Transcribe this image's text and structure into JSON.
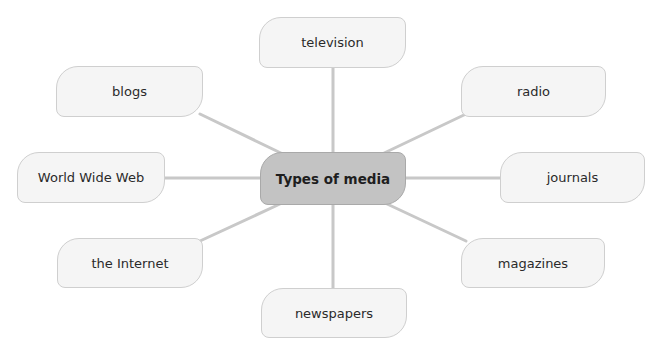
{
  "diagram": {
    "type": "mind-map",
    "line_color": "#c8c8c8",
    "center": {
      "label": "Types of media",
      "fill": "#c3c3c3"
    },
    "nodes": [
      {
        "id": "television",
        "label": "television"
      },
      {
        "id": "radio",
        "label": "radio"
      },
      {
        "id": "journals",
        "label": "journals"
      },
      {
        "id": "magazines",
        "label": "magazines"
      },
      {
        "id": "newspapers",
        "label": "newspapers"
      },
      {
        "id": "the-internet",
        "label": "the Internet"
      },
      {
        "id": "world-wide-web",
        "label": "World Wide Web"
      },
      {
        "id": "blogs",
        "label": "blogs"
      }
    ]
  }
}
